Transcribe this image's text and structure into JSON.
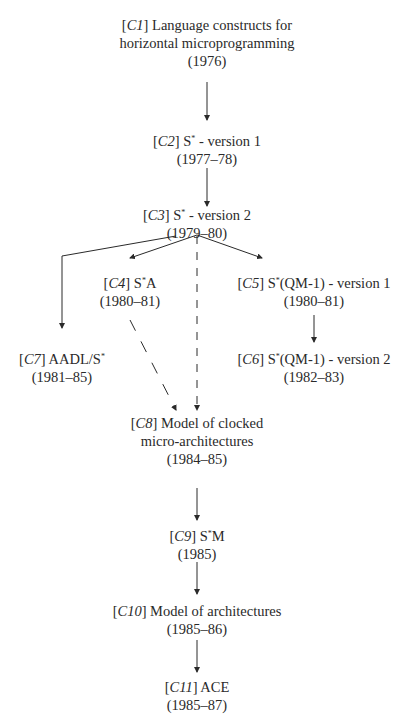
{
  "diagram": {
    "nodes": [
      {
        "id": "C1",
        "num": "1",
        "title_lines": [
          "Language constructs for",
          "horizontal microprogramming"
        ],
        "years": "(1976)"
      },
      {
        "id": "C2",
        "num": "2",
        "title_lines": [
          "S* - version 1"
        ],
        "years": "(1977–78)"
      },
      {
        "id": "C3",
        "num": "3",
        "title_lines": [
          "S* - version 2"
        ],
        "years": "(1979–80)"
      },
      {
        "id": "C4",
        "num": "4",
        "title_lines": [
          "S*A"
        ],
        "years": "(1980–81)"
      },
      {
        "id": "C5",
        "num": "5",
        "title_lines": [
          "S*(QM-1) - version 1"
        ],
        "years": "(1980–81)"
      },
      {
        "id": "C6",
        "num": "6",
        "title_lines": [
          "S*(QM-1) - version 2"
        ],
        "years": "(1982–83)"
      },
      {
        "id": "C7",
        "num": "7",
        "title_lines": [
          "AADL/S*"
        ],
        "years": "(1981–85)"
      },
      {
        "id": "C8",
        "num": "8",
        "title_lines": [
          "Model of clocked",
          "micro-architectures"
        ],
        "years": "(1984–85)"
      },
      {
        "id": "C9",
        "num": "9",
        "title_lines": [
          "S*M"
        ],
        "years": "(1985)"
      },
      {
        "id": "C10",
        "num": "10",
        "title_lines": [
          "Model of architectures"
        ],
        "years": "(1985–86)"
      },
      {
        "id": "C11",
        "num": "11",
        "title_lines": [
          "ACE"
        ],
        "years": "(1985–87)"
      }
    ],
    "edges": [
      {
        "from": "C1",
        "to": "C2",
        "style": "solid"
      },
      {
        "from": "C2",
        "to": "C3",
        "style": "solid"
      },
      {
        "from": "C3",
        "to": "C4",
        "style": "solid"
      },
      {
        "from": "C3",
        "to": "C5",
        "style": "solid"
      },
      {
        "from": "C3",
        "to": "C7",
        "style": "solid"
      },
      {
        "from": "C3",
        "to": "C8",
        "style": "dashed"
      },
      {
        "from": "C4",
        "to": "C8",
        "style": "dashed"
      },
      {
        "from": "C5",
        "to": "C6",
        "style": "solid"
      },
      {
        "from": "C8",
        "to": "C9",
        "style": "solid"
      },
      {
        "from": "C9",
        "to": "C10",
        "style": "solid"
      },
      {
        "from": "C10",
        "to": "C11",
        "style": "solid"
      }
    ]
  },
  "labels": {
    "c1_line1": "Language constructs for",
    "c1_line2": "horizontal microprogramming",
    "c1_years": "(1976)",
    "c2_title": "S",
    "c2_rest": " - version 1",
    "c2_years": "(1977–78)",
    "c3_title": "S",
    "c3_rest": " - version 2",
    "c3_years": "(1979–80)",
    "c4_title": "S",
    "c4_rest": "A",
    "c4_years": "(1980–81)",
    "c5_title": "S",
    "c5_rest": "(QM-1) - version 1",
    "c5_years": "(1980–81)",
    "c6_title": "S",
    "c6_rest": "(QM-1) - version 2",
    "c6_years": "(1982–83)",
    "c7_title": "AADL/S",
    "c7_years": "(1981–85)",
    "c8_line1": "Model of clocked",
    "c8_line2": "micro-architectures",
    "c8_years": "(1984–85)",
    "c9_title": "S",
    "c9_rest": "M",
    "c9_years": "(1985)",
    "c10_title": "Model of architectures",
    "c10_years": "(1985–86)",
    "c11_title": "ACE",
    "c11_years": "(1985–87)",
    "star": "*",
    "ids": {
      "c1": "C",
      "n1": "1",
      "n2": "2",
      "n3": "3",
      "n4": "4",
      "n5": "5",
      "n6": "6",
      "n7": "7",
      "n8": "8",
      "n9": "9",
      "n10": "10",
      "n11": "11"
    }
  }
}
